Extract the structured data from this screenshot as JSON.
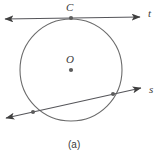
{
  "figure": {
    "caption": "(a)",
    "stroke_color": "#4a4a4a",
    "label_color": "#3b3b3b",
    "background_color": "#ffffff",
    "labels": {
      "tangent_point": "C",
      "center": "O",
      "tangent_line": "t",
      "secant_line": "s"
    },
    "circle": {
      "center_x": 71,
      "center_y": 70,
      "radius": 51
    },
    "tangent_line": {
      "name": "t",
      "x1": 5,
      "y1": 19,
      "x2": 140,
      "y2": 17,
      "arrow_start": true,
      "arrow_end": true,
      "touch_point_x": 71,
      "touch_point_y": 18
    },
    "secant_line": {
      "name": "s",
      "x1": 6,
      "y1": 118,
      "x2": 141,
      "y2": 88,
      "arrow_start": true,
      "arrow_end": true,
      "intersection_1_x": 33,
      "intersection_1_y": 112,
      "intersection_2_x": 113,
      "intersection_2_y": 94
    },
    "center_dot": {
      "x": 71,
      "y": 70,
      "radius": 2.1
    }
  }
}
